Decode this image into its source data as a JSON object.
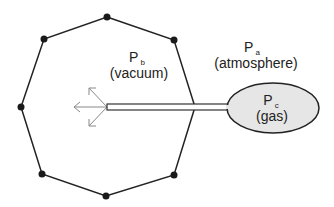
{
  "diagram": {
    "chamber": {
      "shape": "octagon",
      "stroke": "#222222",
      "vertex_dot_color": "#1a1a1a"
    },
    "tube": {
      "stroke": "#333333",
      "fill": "#ffffff"
    },
    "bulb": {
      "fill": "#e6e6e6",
      "stroke": "#222222"
    },
    "arrows": {
      "color": "#888888",
      "count": 3
    },
    "labels": {
      "pb": {
        "symbol": "P",
        "subscript": "b",
        "description": "(vacuum)"
      },
      "pa": {
        "symbol": "P",
        "subscript": "a",
        "description": "(atmosphere)"
      },
      "pc": {
        "symbol": "P",
        "subscript": "c",
        "description": "(gas)"
      }
    }
  }
}
